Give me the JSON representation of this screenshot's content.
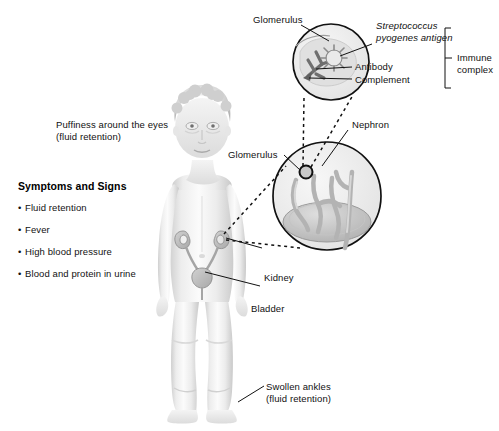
{
  "figure": {
    "title_alt": "Child with acute post-streptococcal glomerulonephritis",
    "background_color": "#ffffff",
    "line_color": "#111111",
    "body_tone": "#e8e8e8",
    "organ_tone": "#b9b9b9"
  },
  "symptoms": {
    "heading": "Symptoms and Signs",
    "items": [
      "Fluid retention",
      "Fever",
      "High blood pressure",
      "Blood and protein in urine"
    ]
  },
  "labels": {
    "puffiness_line1": "Puffiness around the eyes",
    "puffiness_line2": "(fluid retention)",
    "swollen_line1": "Swollen ankles",
    "swollen_line2": "(fluid retention)",
    "kidney": "Kidney",
    "bladder": "Bladder",
    "nephron": "Nephron",
    "glomerulus_mid": "Glomerulus",
    "glomerulus_top": "Glomerulus",
    "antigen_line1": "Streptococcus",
    "antigen_line2": "pyogenes antigen",
    "antibody": "Antibody",
    "complement": "Complement",
    "immune_line1": "Immune",
    "immune_line2": "complex"
  }
}
